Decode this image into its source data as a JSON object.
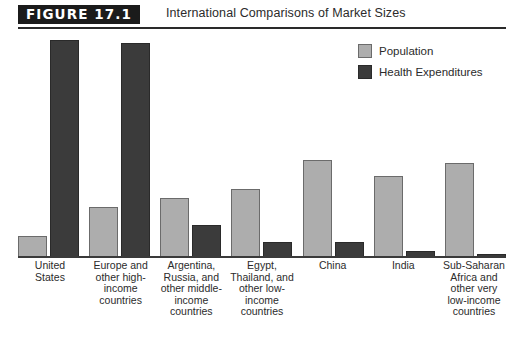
{
  "figure": {
    "badge": "FIGURE 17.1",
    "title": "International Comparisons of Market Sizes"
  },
  "legend": {
    "position": "top-right",
    "items": [
      {
        "label": "Population",
        "color": "#adadad",
        "swatch_name": "population-swatch"
      },
      {
        "label": "Health Expenditures",
        "color": "#3b3b3b",
        "swatch_name": "health-expenditures-swatch"
      }
    ]
  },
  "chart_data": {
    "type": "bar",
    "title": "International Comparisons of Market Sizes",
    "xlabel": "",
    "ylabel": "",
    "grid": false,
    "legend_position": "top-right",
    "ylim": [
      0,
      100
    ],
    "categories": [
      "United\nStates",
      "Europe and\nother high-\nincome\ncountries",
      "Argentina,\nRussia, and\nother middle-\nincome\ncountries",
      "Egypt,\nThailand, and\nother low-\nincome\ncountries",
      "China",
      "India",
      "Sub-Saharan\nAfrica and\nother very\nlow-income\ncountries"
    ],
    "series": [
      {
        "name": "Population",
        "color": "#adadad",
        "values": [
          10,
          23,
          27,
          31,
          44,
          37,
          43
        ]
      },
      {
        "name": "Health Expenditures",
        "color": "#3b3b3b",
        "values": [
          98,
          97,
          15,
          7,
          7,
          3,
          2
        ]
      }
    ]
  }
}
